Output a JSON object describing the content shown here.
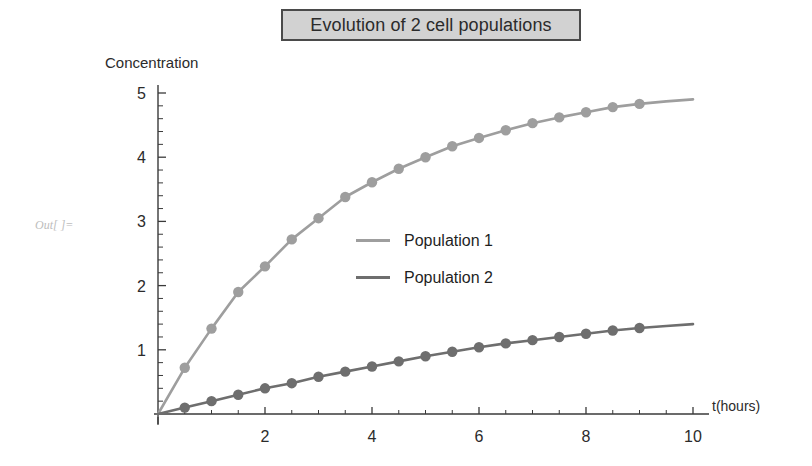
{
  "title": {
    "text": "Evolution of 2 cell populations"
  },
  "out_prompt": {
    "text": "Out[ ]="
  },
  "legend": {
    "items": [
      {
        "label": "Population 1",
        "color": "#9e9e9e"
      },
      {
        "label": "Population 2",
        "color": "#6e6e6e"
      }
    ]
  },
  "chart_data": {
    "type": "line",
    "title": "Evolution of 2 cell populations",
    "xlabel": "t(hours)",
    "ylabel": "Concentration",
    "xlim": [
      0,
      10
    ],
    "ylim": [
      0,
      5
    ],
    "xticks": [
      2,
      4,
      6,
      8,
      10
    ],
    "xtick_labels": [
      "2",
      "4",
      "6",
      "8",
      "10"
    ],
    "yticks": [
      1,
      2,
      3,
      4,
      5
    ],
    "ytick_labels": [
      "1",
      "2",
      "3",
      "4",
      "5"
    ],
    "x_minor_tick_step": 0.5,
    "y_minor_tick_step": 0.2,
    "grid": false,
    "legend_position": "center",
    "marker": "circle",
    "marker_x": [
      0.5,
      1.0,
      1.5,
      2.0,
      2.5,
      3.0,
      3.5,
      4.0,
      4.5,
      5.0,
      5.5,
      6.0,
      6.5,
      7.0,
      7.5,
      8.0,
      8.5,
      9.0
    ],
    "series": [
      {
        "name": "Population 1",
        "color": "#9e9e9e",
        "x": [
          0,
          0.5,
          1.0,
          1.5,
          2.0,
          2.5,
          3.0,
          3.5,
          4.0,
          4.5,
          5.0,
          5.5,
          6.0,
          6.5,
          7.0,
          7.5,
          8.0,
          8.5,
          9.0,
          9.5,
          10.0
        ],
        "values": [
          0,
          0.72,
          1.33,
          1.9,
          2.3,
          2.72,
          3.05,
          3.38,
          3.61,
          3.82,
          4.0,
          4.17,
          4.3,
          4.42,
          4.53,
          4.62,
          4.7,
          4.78,
          4.83,
          4.87,
          4.9
        ]
      },
      {
        "name": "Population 2",
        "color": "#6e6e6e",
        "x": [
          0,
          0.5,
          1.0,
          1.5,
          2.0,
          2.5,
          3.0,
          3.5,
          4.0,
          4.5,
          5.0,
          5.5,
          6.0,
          6.5,
          7.0,
          7.5,
          8.0,
          8.5,
          9.0,
          9.5,
          10.0
        ],
        "values": [
          0,
          0.1,
          0.2,
          0.3,
          0.4,
          0.48,
          0.58,
          0.66,
          0.74,
          0.82,
          0.9,
          0.97,
          1.04,
          1.1,
          1.15,
          1.2,
          1.25,
          1.3,
          1.34,
          1.37,
          1.4
        ]
      }
    ]
  },
  "axes": {
    "origin_px": {
      "x": 158,
      "y": 414
    },
    "x_unit_px": 53.5,
    "y_unit_px": 64.2
  }
}
